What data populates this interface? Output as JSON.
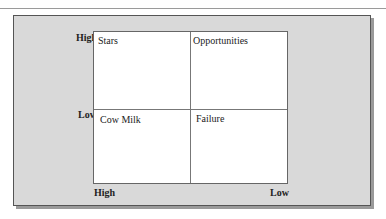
{
  "matrix": {
    "quadrants": [
      {
        "label": "Stars"
      },
      {
        "label": "Opportunities"
      },
      {
        "label": "Cow Milk"
      },
      {
        "label": "Failure"
      }
    ],
    "y_axis": {
      "high": "High",
      "low": "Low"
    },
    "x_axis": {
      "high": "High",
      "low": "Low"
    }
  }
}
